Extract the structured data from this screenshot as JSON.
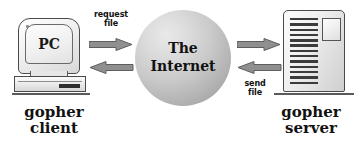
{
  "diagram": {
    "background_color": "#ffffff",
    "nodes": {
      "client": {
        "screen_text": "PC",
        "caption": "gopher\nclient",
        "icon": "desktop-computer-icon"
      },
      "internet": {
        "label": "The\nInternet",
        "icon": "sphere-icon",
        "fill_light": "#e9e9e9",
        "fill_dark": "#949494"
      },
      "server": {
        "caption": "gopher\nserver",
        "icon": "server-tower-icon",
        "slot_count": 13
      }
    },
    "flows": [
      {
        "id": "request-file",
        "label": "request\nfile",
        "direction": "right",
        "from": "client",
        "to": "internet"
      },
      {
        "id": "client-inbound",
        "label": "",
        "direction": "left",
        "from": "internet",
        "to": "client"
      },
      {
        "id": "internet-to-server",
        "label": "",
        "direction": "right",
        "from": "internet",
        "to": "server"
      },
      {
        "id": "send-file",
        "label": "send\nfile",
        "direction": "left",
        "from": "server",
        "to": "internet"
      }
    ],
    "arrow_color": "#8a8a8a",
    "arrow_outline": "#5a5a5a",
    "text_color": "#111111"
  }
}
